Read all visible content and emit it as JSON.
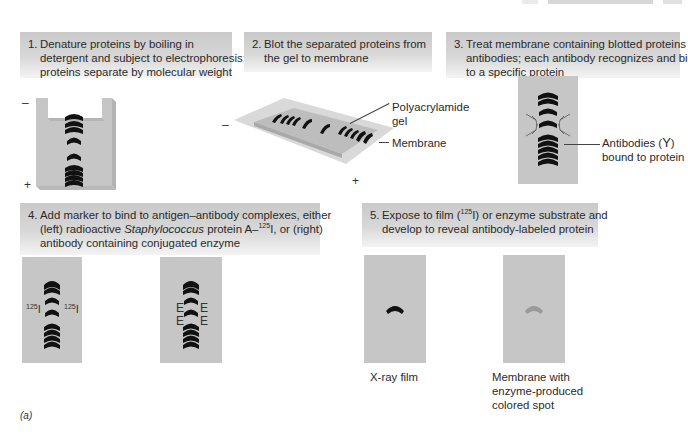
{
  "figure": {
    "tag": "(a)",
    "steps": [
      {
        "number": "1.",
        "lines": [
          "Denature proteins by boiling in",
          "detergent and subject to electrophoresis;",
          "proteins separate by molecular weight"
        ]
      },
      {
        "number": "2.",
        "lines": [
          "Blot the separated proteins from",
          "the gel to membrane"
        ]
      },
      {
        "number": "3.",
        "lines": [
          "Treat membrane containing blotted proteins with",
          "antibodies; each antibody recognizes and binds",
          "to a specific protein"
        ]
      },
      {
        "number": "4.",
        "line1": "Add marker to bind to antigen–antibody complexes, either",
        "line2_pre": "(left) radioactive ",
        "line2_italic": "Staphylococcus",
        "line2_mid": " protein A–",
        "line2_sup": "125",
        "line2_post": "I, or (right)",
        "line3": "antibody containing conjugated enzyme"
      },
      {
        "number": "5.",
        "line1_pre": "Expose to film (",
        "line1_sup": "125",
        "line1_post": "I) or enzyme substrate and",
        "line2": "develop to reveal antibody-labeled protein"
      }
    ],
    "panel1": {
      "minus": "–",
      "plus": "+"
    },
    "panel2": {
      "minus": "–",
      "plus": "+",
      "gel_label_line1": "Polyacrylamide",
      "gel_label_line2": "gel",
      "membrane_label": "Membrane"
    },
    "panel3": {
      "antibody_label_line1": "Antibodies (",
      "antibody_symbol": "Y",
      "antibody_label_close": ")",
      "antibody_label_line2": "bound to protein"
    },
    "panel4": {
      "isotope_mass": "125",
      "isotope_symbol": "I",
      "enzyme_marker": "E"
    },
    "panel5": {
      "xray_label": "X-ray film",
      "membrane_label_line1": "Membrane with",
      "membrane_label_line2": "enzyme-produced",
      "membrane_label_line3": "colored spot"
    },
    "colors": {
      "gel_gray": "#c6c6c6",
      "band_black": "#111111",
      "colored_spot": "#9a9a9a",
      "box_top": "#c9c9c9",
      "box_bottom": "#f4f4f4"
    }
  }
}
